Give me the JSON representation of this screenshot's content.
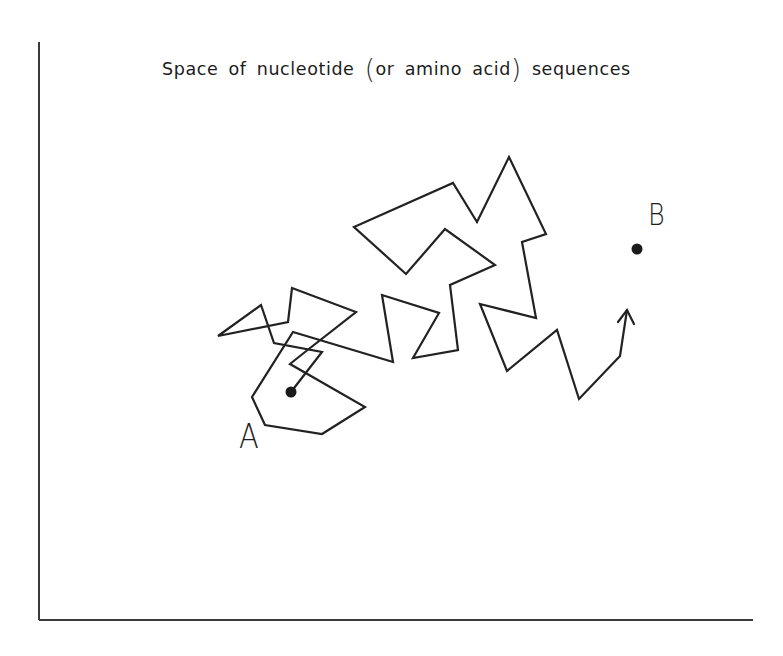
{
  "figure": {
    "title_parts": [
      "Space of nucleotide",
      "(",
      "or amino acid",
      ")",
      "sequences"
    ],
    "start_label": "A",
    "end_label": "B",
    "colors": {
      "ink": "#222222",
      "axis": "#3a3a3a",
      "background": "#ffffff"
    }
  },
  "diagram": {
    "axes": {
      "vertical": {
        "x": 39,
        "y1": 42,
        "y2": 620
      },
      "horizontal": {
        "y": 620,
        "x1": 39,
        "x2": 753
      }
    },
    "point_a": {
      "x": 291,
      "y": 392,
      "r": 5.5
    },
    "point_b": {
      "x": 637,
      "y": 249,
      "r": 5.5
    },
    "random_walk_path": [
      [
        291,
        392
      ],
      [
        322,
        352
      ],
      [
        274,
        343
      ],
      [
        261,
        305
      ],
      [
        218,
        336
      ],
      [
        288,
        322
      ],
      [
        292,
        288
      ],
      [
        356,
        312
      ],
      [
        305,
        352
      ],
      [
        290,
        364
      ],
      [
        365,
        407
      ],
      [
        322,
        434
      ],
      [
        265,
        425
      ],
      [
        252,
        397
      ],
      [
        293,
        332
      ],
      [
        393,
        362
      ],
      [
        382,
        295
      ],
      [
        439,
        313
      ],
      [
        413,
        358
      ],
      [
        458,
        350
      ],
      [
        450,
        285
      ],
      [
        495,
        265
      ],
      [
        445,
        229
      ],
      [
        406,
        274
      ],
      [
        354,
        227
      ],
      [
        453,
        183
      ],
      [
        477,
        222
      ],
      [
        509,
        157
      ],
      [
        546,
        234
      ],
      [
        522,
        242
      ],
      [
        536,
        318
      ],
      [
        480,
        304
      ],
      [
        507,
        371
      ],
      [
        557,
        330
      ],
      [
        579,
        399
      ],
      [
        620,
        356
      ],
      [
        627,
        310
      ]
    ],
    "arrowhead": {
      "tip": [
        627,
        310
      ],
      "left": [
        618,
        322
      ],
      "right": [
        634,
        324
      ]
    }
  }
}
